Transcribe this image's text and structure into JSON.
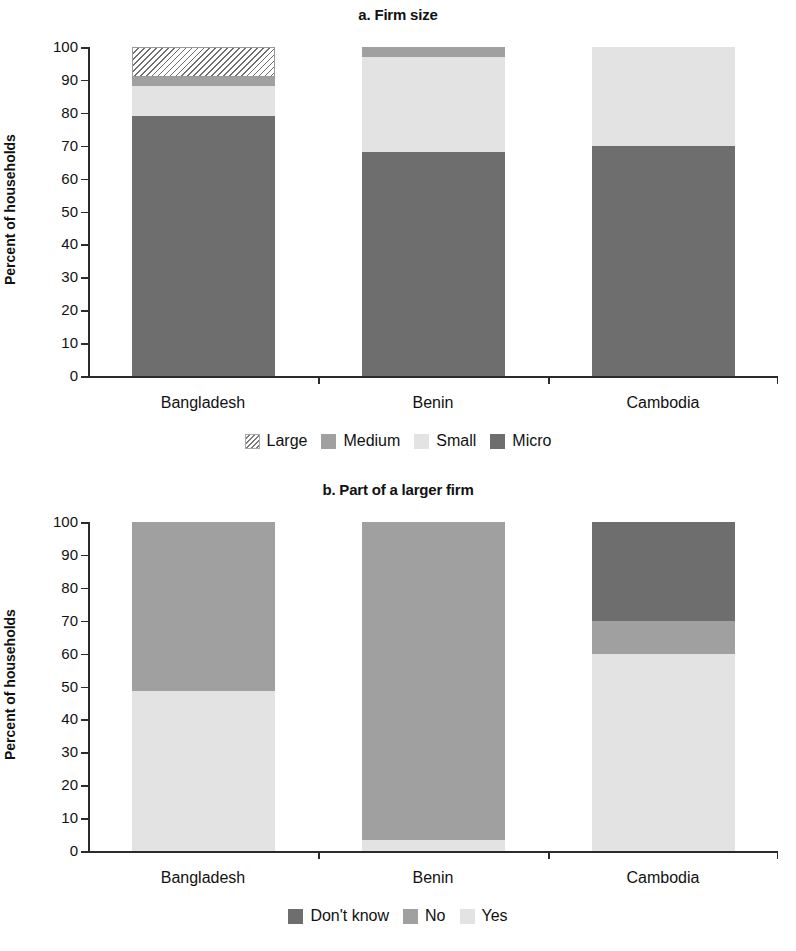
{
  "figure": {
    "ylabel": "Percent of households",
    "categories": [
      "Bangladesh",
      "Benin",
      "Cambodia"
    ],
    "y_ticks": [
      "100",
      "90",
      "80",
      "70",
      "60",
      "50",
      "40",
      "30",
      "20",
      "10",
      "0"
    ],
    "colors": {
      "micro": "#6e6e6e",
      "small": "#e3e3e3",
      "medium": "#a0a0a0",
      "large": "#ffffff",
      "dont_know": "#6e6e6e",
      "no": "#a0a0a0",
      "yes": "#e3e3e3",
      "axis": "#2b2b2b",
      "text": "#111111",
      "background": "#ffffff"
    }
  },
  "chart_data": [
    {
      "type": "bar",
      "id": "panel-a",
      "title": "a. Firm size",
      "stacked": true,
      "xlabel": "",
      "ylabel": "Percent of households",
      "ylim": [
        0,
        100
      ],
      "yticks": [
        0,
        10,
        20,
        30,
        40,
        50,
        60,
        70,
        80,
        90,
        100
      ],
      "grid": false,
      "legend_position": "bottom",
      "categories": [
        "Bangladesh",
        "Benin",
        "Cambodia"
      ],
      "series": [
        {
          "name": "Micro",
          "color": "#6e6e6e",
          "pattern": "solid",
          "values": [
            79,
            68,
            70
          ]
        },
        {
          "name": "Small",
          "color": "#e3e3e3",
          "pattern": "solid",
          "values": [
            9,
            29,
            30
          ]
        },
        {
          "name": "Medium",
          "color": "#a0a0a0",
          "pattern": "solid",
          "values": [
            3,
            3,
            0
          ]
        },
        {
          "name": "Large",
          "color": "#ffffff",
          "pattern": "hatched",
          "values": [
            9,
            0,
            0
          ]
        }
      ],
      "legend_order": [
        "Large",
        "Medium",
        "Small",
        "Micro"
      ]
    },
    {
      "type": "bar",
      "id": "panel-b",
      "title": "b. Part of a larger firm",
      "stacked": true,
      "xlabel": "",
      "ylabel": "Percent of households",
      "ylim": [
        0,
        100
      ],
      "yticks": [
        0,
        10,
        20,
        30,
        40,
        50,
        60,
        70,
        80,
        90,
        100
      ],
      "grid": false,
      "legend_position": "bottom",
      "categories": [
        "Bangladesh",
        "Benin",
        "Cambodia"
      ],
      "series": [
        {
          "name": "Yes",
          "color": "#e3e3e3",
          "pattern": "solid",
          "values": [
            48.5,
            3.5,
            60
          ]
        },
        {
          "name": "No",
          "color": "#a0a0a0",
          "pattern": "solid",
          "values": [
            51.5,
            96.5,
            10
          ]
        },
        {
          "name": "Don't know",
          "color": "#6e6e6e",
          "pattern": "solid",
          "values": [
            0,
            0,
            30
          ]
        }
      ],
      "legend_order": [
        "Don't know",
        "No",
        "Yes"
      ]
    }
  ]
}
